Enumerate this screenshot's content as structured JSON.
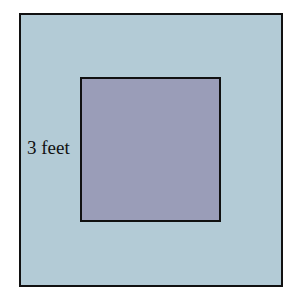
{
  "diagram": {
    "title": "",
    "outer_square": {
      "fill": "#b3cbd6",
      "border": "#111111"
    },
    "inner_square": {
      "fill": "#9a9db8",
      "border": "#111111"
    },
    "label": "3 feet"
  }
}
